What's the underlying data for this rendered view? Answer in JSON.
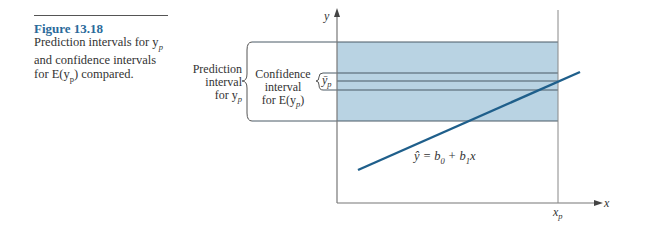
{
  "caption": {
    "figure_number": "Figure 13.18",
    "text_line1": "Prediction intervals for y",
    "text_line1_sub": "p",
    "text_line2": "and confidence intervals",
    "text_line3_pre": "for E(y",
    "text_line3_sub": "p",
    "text_line3_post": ") compared."
  },
  "labels": {
    "prediction_interval": [
      "Prediction",
      "interval",
      "for y"
    ],
    "prediction_interval_sub": "p",
    "confidence_interval": [
      "Confidence",
      "interval",
      "for E(y"
    ],
    "confidence_interval_sub": "p",
    "confidence_interval_post": ")",
    "ybar": "ȳ",
    "ybar_sub": "p",
    "y_axis": "y",
    "x_axis": "x",
    "xp": "x",
    "xp_sub": "p",
    "equation_lhs": "ŷ = b",
    "equation_sub0": "0",
    "equation_mid": " + b",
    "equation_sub1": "1",
    "equation_rhs": "x"
  },
  "colors": {
    "band_fill": "#b9d3e3",
    "line_color": "#1f5f8b",
    "band_border": "#4a5a66",
    "axis": "#777777",
    "caption_accent": "#2a6a9a"
  },
  "geometry": {
    "prediction_band": {
      "top": 42,
      "bottom": 121
    },
    "confidence_lines": [
      73,
      81,
      90
    ],
    "x_axis_y": 203,
    "y_axis_x": 337,
    "xp_x": 558,
    "regression_line": {
      "x1": 358,
      "y1": 170,
      "x2": 580,
      "y2": 72
    }
  }
}
